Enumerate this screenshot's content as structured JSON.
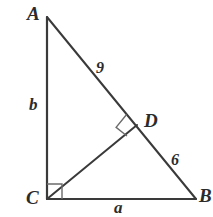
{
  "figure": {
    "kind": "right-triangle-with-altitude",
    "colors": {
      "background": "#ffffff",
      "stroke": "#3a3a3a",
      "label": "#2b2b2b"
    },
    "vertices": {
      "A": {
        "label": "A",
        "x": 47,
        "y": 17
      },
      "C": {
        "label": "C",
        "x": 47,
        "y": 199
      },
      "B": {
        "label": "B",
        "x": 196,
        "y": 199
      },
      "D": {
        "label": "D",
        "x": 137,
        "y": 125
      }
    },
    "segments": [
      {
        "name": "AC",
        "from": "A",
        "to": "C",
        "label": "b"
      },
      {
        "name": "CB",
        "from": "C",
        "to": "B",
        "label": "a"
      },
      {
        "name": "AD",
        "from": "A",
        "to": "D",
        "label": "9"
      },
      {
        "name": "DB",
        "from": "D",
        "to": "B",
        "label": "6"
      },
      {
        "name": "CD",
        "from": "C",
        "to": "D",
        "label": ""
      }
    ],
    "side_labels": {
      "AC": "b",
      "CB": "a",
      "AD": "9",
      "DB": "6"
    },
    "right_angles": [
      {
        "at": "C",
        "between": [
          "CA",
          "CB"
        ]
      },
      {
        "at": "D",
        "between": [
          "DC",
          "DA"
        ]
      }
    ]
  }
}
